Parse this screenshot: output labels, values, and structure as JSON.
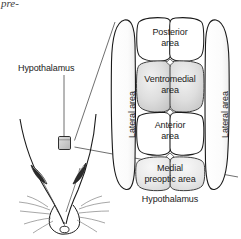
{
  "figure": {
    "kind": "anatomical-diagram",
    "cropped_running_text": "pre-"
  },
  "callout": {
    "source_label": "Hypothalamus",
    "target_caption": "Hypothalamus"
  },
  "regions": {
    "posterior": {
      "line1": "Posterior",
      "line2": "area",
      "fill": "#ffffff"
    },
    "ventromedial": {
      "line1": "Ventromedial",
      "line2": "area",
      "fill": "#d8d8d8"
    },
    "anterior": {
      "line1": "Anterior",
      "line2": "area",
      "fill": "#ffffff"
    },
    "medial_preoptic": {
      "line1": "Medial",
      "line2": "preoptic area",
      "fill": "#e6e6e6"
    },
    "lateral_left": {
      "label": "Lateral area",
      "fill": "#ffffff"
    },
    "lateral_right": {
      "label": "Lateral area",
      "fill": "#ffffff"
    }
  },
  "colors": {
    "stroke": "#1a1a1a",
    "soft_stroke": "#4a4a4a",
    "text": "#1a1a1a",
    "shade_dark": "#d4d4d4",
    "shade_light": "#e8e8e8",
    "background": "#ffffff",
    "probe_fill": "#c9c9c9"
  }
}
